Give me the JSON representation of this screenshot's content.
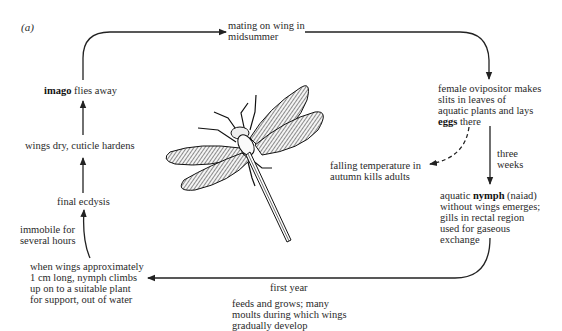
{
  "figure": {
    "panel_label": "(a)",
    "colors": {
      "line": "#222222",
      "text": "#2a2a2a",
      "background": "#ffffff"
    }
  },
  "stages": {
    "mating": {
      "line1": "mating on wing in",
      "line2": "midsummer"
    },
    "ovipositor": {
      "line1": "female ovipositor makes",
      "line2": "slits in leaves of",
      "line3": "aquatic plants and lays",
      "line4_bold": "eggs",
      "line4_rest": " there"
    },
    "three_weeks": {
      "line1": "three",
      "line2": "weeks"
    },
    "autumn": {
      "line1": "falling temperature in",
      "line2": "autumn kills adults"
    },
    "nymph": {
      "line1_pre": "aquatic ",
      "line1_bold": "nymph",
      "line1_post": " (naiad)",
      "line2": "without wings emerges;",
      "line3": "gills in rectal region",
      "line4": "used for gaseous",
      "line5": "exchange"
    },
    "first_year": "first year",
    "feeds": {
      "line1": "feeds and grows; many",
      "line2": "moults during which wings",
      "line3": "gradually develop"
    },
    "climbs": {
      "line1": "when wings approximately",
      "line2": "1 cm long, nymph climbs",
      "line3": "up on to a suitable plant",
      "line4": "for support, out of water"
    },
    "immobile": {
      "line1": "immobile for",
      "line2": "several hours"
    },
    "final_ecdysis": "final ecdysis",
    "wings_dry": "wings dry, cuticle hardens",
    "imago": {
      "bold": "imago",
      "rest": " flies away"
    }
  },
  "illustration": {
    "subject": "dragonfly-adult",
    "style": "engraving"
  }
}
